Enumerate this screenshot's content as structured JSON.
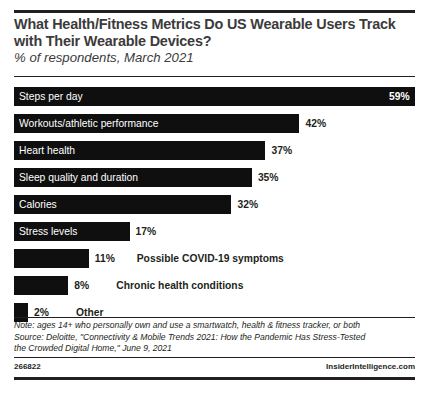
{
  "header": {
    "title": "What Health/Fitness Metrics Do US Wearable Users Track with Their Wearable Devices?",
    "subtitle": "% of respondents, March 2021"
  },
  "chart_data": {
    "type": "bar",
    "title": "What Health/Fitness Metrics Do US Wearable Users Track with Their Wearable Devices?",
    "subtitle": "% of respondents, March 2021",
    "xlabel": "",
    "ylabel": "",
    "orientation": "horizontal",
    "grid": false,
    "legend": false,
    "xlim": [
      0,
      59
    ],
    "categories": [
      "Steps per day",
      "Workouts/athletic performance",
      "Heart health",
      "Sleep quality and duration",
      "Calories",
      "Stress levels",
      "Possible COVID-19 symptoms",
      "Chronic health conditions",
      "Other"
    ],
    "values": [
      59,
      42,
      37,
      35,
      32,
      17,
      11,
      8,
      2
    ],
    "value_labels": [
      "59%",
      "42%",
      "37%",
      "35%",
      "32%",
      "17%",
      "11%",
      "8%",
      "2%"
    ],
    "bar_color": "#0f0f0f",
    "label_inside": [
      true,
      true,
      true,
      true,
      true,
      true,
      false,
      false,
      false
    ],
    "value_inside": [
      true,
      false,
      false,
      false,
      false,
      false,
      false,
      false,
      false
    ]
  },
  "note": {
    "line1": "Note: ages 14+ who personally own and use a smartwatch, health & fitness tracker, or both",
    "line2": "Source: Deloitte, \"Connectivity & Mobile Trends 2021: How the Pandemic Has Stress-Tested",
    "line3": "the Crowded Digital Home,\" June 9, 2021"
  },
  "footer": {
    "id": "266822",
    "brand": "InsiderIntelligence.com"
  }
}
